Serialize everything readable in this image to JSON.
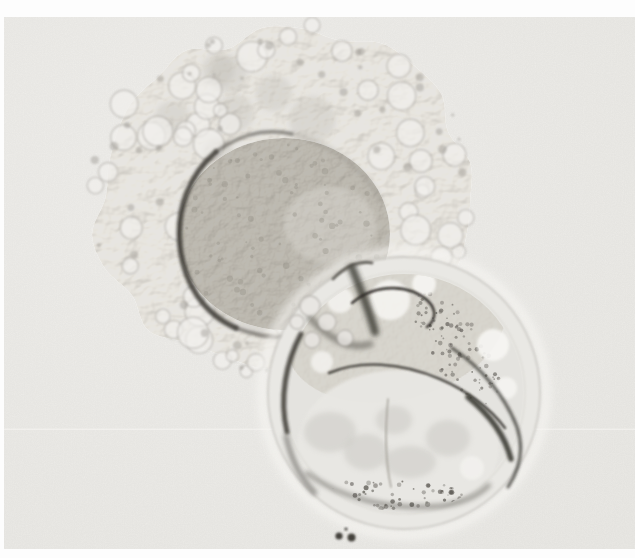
{
  "meta": {
    "image_type": "micrograph"
  },
  "canvas": {
    "width": 635,
    "height": 558,
    "page_background": "#fdfdfd"
  },
  "photo": {
    "x": 4,
    "y": 17,
    "width": 631,
    "height": 532,
    "background": "#f2f1ee",
    "vignette_edge": "#ecebe7",
    "grain_opacity": 0.12,
    "scanline": {
      "y": 428.5,
      "height": 1.5,
      "color": "#f9f8f5",
      "opacity": 0.5
    }
  },
  "cumulus_complex": {
    "cx": 282,
    "cy": 198,
    "rx": 188,
    "ry": 168,
    "edge_points": 30,
    "edge_jitter": 0.09,
    "edge_seed": 11,
    "fill": "#e7e5e1",
    "soft_blobs": {
      "count": 14,
      "seed": 17,
      "fill": "#b3b0a9",
      "opacity": 0.25,
      "r_min": 13,
      "r_max": 24
    },
    "bubbles": {
      "count": 66,
      "seed": 5,
      "fill": "#f1f0ed",
      "stroke": "#9b9791",
      "r_min": 6,
      "r_max": 16
    },
    "dark_dots": {
      "count": 48,
      "seed": 9,
      "fill": "#8e8a84",
      "opacity": 0.38,
      "r_min": 1.5,
      "r_max": 4.5
    }
  },
  "oocyte": {
    "cx": 284,
    "cy": 234,
    "rx": 106,
    "ry": 96,
    "fill": "#bdbab3",
    "highlight": {
      "cx": 330,
      "cy": 225,
      "rx": 46,
      "ry": 38,
      "fill": "#e9e7e2",
      "opacity": 0.3
    },
    "grains": {
      "count": 80,
      "seed": 21,
      "fill": "#878379",
      "opacity": 0.3,
      "r_min": 1,
      "r_max": 3.4
    },
    "rim_arcs": [
      {
        "d": "M216,152 C190,174 176,208 180,246 C184,284 204,314 236,328",
        "w": 5.5,
        "c": "#3b3833",
        "blur": "b2",
        "o": 0.85
      },
      {
        "d": "M216,152 C240,134 266,128 292,134",
        "w": 3.5,
        "c": "#4a4641",
        "blur": "b2",
        "o": 0.6
      },
      {
        "d": "M292,134 C332,144 364,168 382,202",
        "w": 2.5,
        "c": "#6a6660",
        "blur": "b3",
        "o": 0.35
      },
      {
        "d": "M236,328 C262,338 290,340 316,332",
        "w": 4,
        "c": "#44413b",
        "blur": "b2",
        "o": 0.55
      }
    ]
  },
  "blastocyst": {
    "cx": 404,
    "cy": 393,
    "r": 136,
    "halo_stroke": "#f6f5f2",
    "body_fill": "#e9e8e4",
    "outer_stroke": "#c9c7c2",
    "zona_inner_stroke": "#d4d2cd",
    "interior_fill": "#e4e3df",
    "icm": {
      "cx": 396,
      "cy": 328,
      "rx": 112,
      "ry": 72,
      "rot": -14,
      "fill": "#d6d4ce"
    },
    "cavity": {
      "cx": 398,
      "cy": 447,
      "rx": 101,
      "ry": 77,
      "fill": "#e8e7e3",
      "shadow_fill": "#c8c6c1",
      "shadows": [
        {
          "cx": 330,
          "cy": 432,
          "rx": 26,
          "ry": 20
        },
        {
          "cx": 366,
          "cy": 452,
          "rx": 22,
          "ry": 18
        },
        {
          "cx": 410,
          "cy": 462,
          "rx": 26,
          "ry": 16
        },
        {
          "cx": 448,
          "cy": 438,
          "rx": 22,
          "ry": 18
        },
        {
          "cx": 394,
          "cy": 420,
          "rx": 18,
          "ry": 14
        }
      ]
    },
    "speckle_band": {
      "cx": 456,
      "cy": 348,
      "rx": 66,
      "ry": 27,
      "rot": 55,
      "count": 95,
      "seed": 31,
      "fill": "#6e6b65",
      "o_min": 0.35,
      "o_max": 0.8,
      "r_min": 0.7,
      "r_max": 2.4
    },
    "bottom_speckles": {
      "cx": 392,
      "cy": 494,
      "rx": 86,
      "ry": 15,
      "rot": 0,
      "count": 60,
      "seed": 41,
      "fill": "#55524c",
      "o_min": 0.3,
      "o_max": 0.75,
      "r_min": 0.8,
      "r_max": 2.6
    },
    "bright_fill": "#f7f6f3",
    "bright_blobs": [
      {
        "cx": 493,
        "cy": 345,
        "r": 16,
        "o": 0.9
      },
      {
        "cx": 506,
        "cy": 388,
        "r": 11,
        "o": 0.8
      },
      {
        "cx": 424,
        "cy": 284,
        "r": 12,
        "o": 0.9
      },
      {
        "cx": 390,
        "cy": 300,
        "r": 20,
        "o": 0.85
      },
      {
        "cx": 340,
        "cy": 300,
        "r": 13,
        "o": 0.8
      },
      {
        "cx": 322,
        "cy": 362,
        "r": 11,
        "o": 0.75
      },
      {
        "cx": 472,
        "cy": 468,
        "r": 12,
        "o": 0.6
      }
    ]
  },
  "dark_lines": [
    {
      "name": "blastocyst-upper-left-rim",
      "d": "M301,334 C286,362 279,398 287,432",
      "w": 5,
      "c": "#3a3833",
      "blur": "b2",
      "o": 0.85
    },
    {
      "name": "junction-streak",
      "d": "M352,268 C361,290 369,310 375,332",
      "w": 8,
      "c": "#333029",
      "blur": "b3",
      "o": 0.8
    },
    {
      "name": "junction-patch",
      "d": "M310,318 C330,340 352,350 370,344",
      "w": 7,
      "c": "#4a4741",
      "blur": "b3",
      "o": 0.5
    },
    {
      "name": "icm-filament",
      "d": "M352,303 C378,281 412,286 428,301 C437,310 436,320 427,327",
      "w": 2.6,
      "c": "#2e2c28",
      "blur": "b1",
      "o": 0.9
    },
    {
      "name": "icm-upper-squiggle",
      "d": "M333,279 C345,266 360,260 372,263",
      "w": 3,
      "c": "#403d37",
      "blur": "b1",
      "o": 0.7
    },
    {
      "name": "cavity-roof-line",
      "d": "M329,373 C360,360 400,362 440,379 C466,390 490,408 505,428",
      "w": 2.6,
      "c": "#43403b",
      "blur": "b1",
      "o": 0.9
    },
    {
      "name": "cavity-roof-thick",
      "d": "M468,397 C490,415 505,436 511,459",
      "w": 5.5,
      "c": "#33312c",
      "blur": "b2",
      "o": 0.85
    },
    {
      "name": "right-rim-arc",
      "d": "M452,348 C481,367 505,396 517,427 C524,448 520,469 508,487",
      "w": 3,
      "c": "#36342f",
      "blur": "b2",
      "o": 0.8
    },
    {
      "name": "bottom-arc",
      "d": "M307,473 C340,498 390,511 441,506 C463,503 479,495 489,485",
      "w": 4,
      "c": "#4b4842",
      "blur": "b3",
      "o": 0.55
    },
    {
      "name": "left-rim-segment",
      "d": "M286,436 C291,459 301,479 315,493",
      "w": 4,
      "c": "#45423c",
      "blur": "b3",
      "o": 0.65
    },
    {
      "name": "cavity-midline",
      "d": "M388,399 C385,430 385,460 391,487",
      "w": 1.6,
      "c": "#9b988f",
      "blur": "b1",
      "o": 0.8
    }
  ],
  "overlap_bubbles": [
    {
      "cx": 310,
      "cy": 306,
      "r": 10
    },
    {
      "cx": 327,
      "cy": 322,
      "r": 9
    },
    {
      "cx": 345,
      "cy": 338,
      "r": 8
    },
    {
      "cx": 312,
      "cy": 340,
      "r": 8
    },
    {
      "cx": 297,
      "cy": 322,
      "r": 7
    }
  ],
  "overlap_bubble_style": {
    "fill": "#e8e6e2",
    "stroke": "#8f8c86"
  },
  "debris": {
    "fill": "#45433e",
    "dots": [
      {
        "cx": 339,
        "cy": 536,
        "r": 3.6
      },
      {
        "cx": 351.5,
        "cy": 537.5,
        "r": 4.0
      },
      {
        "cx": 346,
        "cy": 529,
        "r": 1.6
      }
    ]
  }
}
